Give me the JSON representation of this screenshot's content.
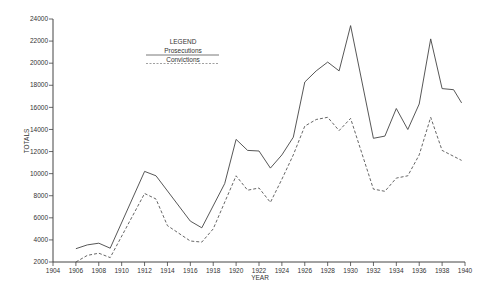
{
  "chart_data": {
    "type": "line",
    "title": "",
    "xlabel": "YEAR",
    "ylabel": "TOTALS",
    "xlim": [
      1904,
      1940
    ],
    "ylim": [
      2000,
      24000
    ],
    "x_ticks": [
      1904,
      1906,
      1908,
      1910,
      1912,
      1914,
      1916,
      1918,
      1920,
      1922,
      1924,
      1926,
      1928,
      1930,
      1932,
      1934,
      1936,
      1938,
      1940
    ],
    "y_ticks": [
      2000,
      4000,
      6000,
      8000,
      10000,
      12000,
      14000,
      16000,
      18000,
      20000,
      22000,
      24000
    ],
    "grid": false,
    "legend": {
      "title": "LEGEND",
      "position": "upper-left-center",
      "entries": [
        {
          "label": "Prosecutions",
          "style": "solid"
        },
        {
          "label": "Convictions",
          "style": "dashed"
        }
      ]
    },
    "series": [
      {
        "name": "Prosecutions",
        "style": "solid",
        "x": [
          1906,
          1907,
          1908,
          1909,
          1912,
          1913,
          1916,
          1917,
          1919,
          1920,
          1921,
          1922,
          1923,
          1924,
          1925,
          1926,
          1927,
          1928,
          1929,
          1930,
          1932,
          1933,
          1934,
          1935,
          1936,
          1937,
          1938,
          1939,
          1939.7
        ],
        "values": [
          3200,
          3550,
          3700,
          3250,
          10200,
          9800,
          5700,
          5100,
          9100,
          13100,
          12100,
          12050,
          10500,
          11700,
          13300,
          18300,
          19300,
          20100,
          19300,
          23400,
          13200,
          13400,
          15900,
          14000,
          16300,
          22200,
          17700,
          17600,
          16400
        ]
      },
      {
        "name": "Convictions",
        "style": "dashed",
        "x": [
          1906,
          1907,
          1908,
          1909,
          1912,
          1913,
          1914,
          1916,
          1917,
          1918,
          1920,
          1921,
          1922,
          1923,
          1924,
          1925,
          1926,
          1927,
          1928,
          1929,
          1930,
          1932,
          1933,
          1934,
          1935,
          1936,
          1937,
          1938,
          1939.7
        ],
        "values": [
          2000,
          2600,
          2800,
          2400,
          8200,
          7700,
          5300,
          3900,
          3800,
          5000,
          9800,
          8500,
          8700,
          7400,
          9500,
          11700,
          14300,
          14900,
          15100,
          13900,
          15000,
          8600,
          8400,
          9600,
          9800,
          11700,
          15100,
          12100,
          11200
        ]
      }
    ]
  }
}
